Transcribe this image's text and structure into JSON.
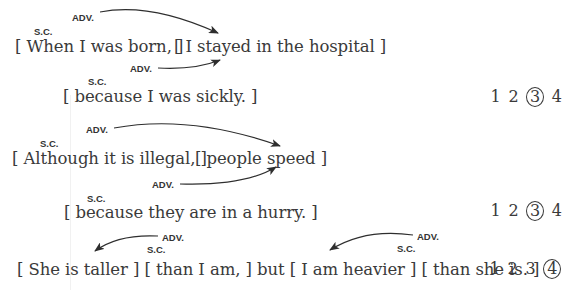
{
  "examples": [
    {
      "main_clause": {
        "sc_label": "S.C.",
        "adv_label": "ADV.",
        "subordinate": "[ When I was born, ]",
        "independent": "[ I stayed in the hospital ]"
      },
      "second_clause": {
        "sc_label": "S.C.",
        "adv_label": "ADV.",
        "subordinate": "[ because I was sickly. ]"
      },
      "choices": [
        "1",
        "2",
        "3",
        "4"
      ],
      "selected": "3"
    },
    {
      "main_clause": {
        "sc_label": "S.C.",
        "adv_label": "ADV.",
        "subordinate": "[ Although it is illegal, ]",
        "independent": "[ people speed ]"
      },
      "second_clause": {
        "sc_label": "S.C.",
        "adv_label": "ADV.",
        "subordinate": "[ because they are in a hurry. ]"
      },
      "choices": [
        "1",
        "2",
        "3",
        "4"
      ],
      "selected": "3"
    },
    {
      "labels": {
        "adv_1": "ADV.",
        "sc_1": "S.C.",
        "adv_2": "ADV.",
        "sc_2": "S.C."
      },
      "sentence": "[ She is taller ] [ than I am, ] but [ I am heavier ] [ than she is. ]",
      "choices": [
        "1",
        "2",
        "3",
        "4"
      ],
      "selected": "4"
    }
  ],
  "colors": {
    "text": "#3a3a3a",
    "label": "#333333",
    "arrow": "#2e2e2e",
    "background": "#ffffff"
  }
}
